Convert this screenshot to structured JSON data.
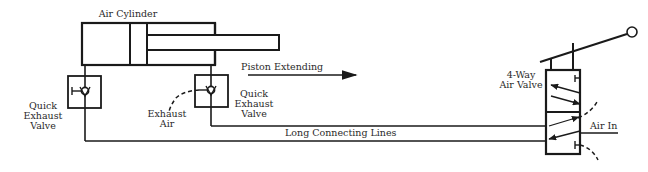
{
  "diagram": {
    "cylinder": {
      "label": "Air Cylinder"
    },
    "left_qev": {
      "label_line1": "Quick",
      "label_line2": "Exhaust",
      "label_line3": "Valve"
    },
    "right_qev": {
      "label_line1": "Quick",
      "label_line2": "Exhaust",
      "label_line3": "Valve"
    },
    "exhaust_air": {
      "label_line1": "Exhaust",
      "label_line2": "Air"
    },
    "motion": {
      "label": "Piston Extending"
    },
    "lines": {
      "label": "Long Connecting Lines"
    },
    "four_way_valve": {
      "label_line1": "4-Way",
      "label_line2": "Air Valve"
    },
    "air_in": {
      "label": "Air In"
    },
    "colors": {
      "line": "#1a1a1a",
      "text": "#2a2a2a",
      "background": "#ffffff"
    }
  }
}
